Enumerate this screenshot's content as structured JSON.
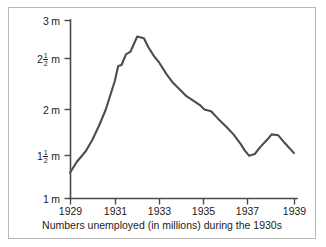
{
  "figure": {
    "caption": "Numbers unemployed (in millions) during the 1930s",
    "frame_color": "#b8b8b8",
    "line_color": "#4c4c4c",
    "axis_color": "#4a4a4a",
    "background": "#ffffff"
  },
  "y_axis": {
    "ticks": [
      {
        "whole": "3",
        "numer": "",
        "denom": "",
        "unit": "m",
        "value": 3.0
      },
      {
        "whole": "2",
        "numer": "1",
        "denom": "2",
        "unit": "m",
        "value": 2.5
      },
      {
        "whole": "2",
        "numer": "",
        "denom": "",
        "unit": "m",
        "value": 2.0
      },
      {
        "whole": "1",
        "numer": "1",
        "denom": "2",
        "unit": "m",
        "value": 1.5
      },
      {
        "whole": "1",
        "numer": "",
        "denom": "",
        "unit": "m",
        "value": 1.0
      }
    ]
  },
  "x_axis": {
    "ticks": [
      "1929",
      "1931",
      "1933",
      "1935",
      "1937",
      "1939"
    ]
  },
  "chart_data": {
    "type": "line",
    "title": "",
    "subtitle": "",
    "caption": "Numbers unemployed (in millions) during the 1930s",
    "xlabel": "",
    "ylabel": "",
    "xlim": [
      1929,
      1939
    ],
    "ylim": [
      1.0,
      3.0
    ],
    "ytick_values": [
      1.0,
      1.5,
      2.0,
      2.5,
      3.0
    ],
    "ytick_labels": [
      "1 m",
      "1 1/2 m",
      "2 m",
      "2 1/2 m",
      "3 m"
    ],
    "xtick_values": [
      1929,
      1931,
      1933,
      1935,
      1937,
      1939
    ],
    "xtick_labels": [
      "1929",
      "1931",
      "1933",
      "1935",
      "1937",
      "1939"
    ],
    "grid": false,
    "legend": false,
    "units": "millions",
    "series": [
      {
        "name": "Numbers unemployed",
        "x": [
          1929.0,
          1929.3,
          1929.7,
          1930.0,
          1930.3,
          1930.6,
          1931.0,
          1931.15,
          1931.3,
          1931.5,
          1931.7,
          1932.0,
          1932.3,
          1932.5,
          1932.75,
          1933.0,
          1933.3,
          1933.6,
          1934.0,
          1934.2,
          1934.5,
          1934.8,
          1935.0,
          1935.3,
          1935.6,
          1936.0,
          1936.3,
          1936.6,
          1936.8,
          1937.0,
          1937.25,
          1937.5,
          1937.8,
          1938.0,
          1938.3,
          1938.6,
          1939.0
        ],
        "y": [
          1.29,
          1.41,
          1.53,
          1.66,
          1.82,
          2.0,
          2.32,
          2.49,
          2.5,
          2.62,
          2.65,
          2.82,
          2.8,
          2.7,
          2.6,
          2.52,
          2.4,
          2.3,
          2.2,
          2.15,
          2.1,
          2.05,
          2.0,
          1.98,
          1.9,
          1.8,
          1.72,
          1.62,
          1.54,
          1.48,
          1.5,
          1.58,
          1.66,
          1.72,
          1.71,
          1.62,
          1.51
        ]
      }
    ],
    "annotations": {
      "peak_year": 1932,
      "peak_value": 2.82,
      "trough_year": 1937,
      "trough_value": 1.48,
      "start_value": 1.29,
      "end_value": 1.51
    }
  }
}
